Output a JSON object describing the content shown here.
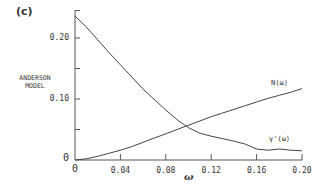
{
  "panel_label": "(c)",
  "chart_data": {
    "type": "line",
    "title": "",
    "ylabel": "ANDERSON MODEL",
    "xlabel": "ω",
    "xlim": [
      0,
      0.2
    ],
    "ylim": [
      0,
      0.24
    ],
    "x_ticks": [
      "0",
      "0.04",
      "0.08",
      "0.12",
      "0.16",
      "0.20"
    ],
    "y_ticks": [
      "0",
      "0.10",
      "0.20"
    ],
    "grid": false,
    "series": [
      {
        "name": "N(ω)",
        "x": [
          0,
          0.01,
          0.02,
          0.03,
          0.04,
          0.05,
          0.06,
          0.07,
          0.08,
          0.09,
          0.1,
          0.11,
          0.12,
          0.13,
          0.14,
          0.15,
          0.16,
          0.17,
          0.18,
          0.19,
          0.2
        ],
        "values": [
          0,
          0.002,
          0.006,
          0.011,
          0.016,
          0.022,
          0.029,
          0.036,
          0.043,
          0.05,
          0.057,
          0.064,
          0.071,
          0.077,
          0.083,
          0.089,
          0.095,
          0.101,
          0.106,
          0.111,
          0.117
        ]
      },
      {
        "name": "γ'(ω)",
        "x": [
          0,
          0.01,
          0.02,
          0.03,
          0.04,
          0.05,
          0.06,
          0.07,
          0.08,
          0.09,
          0.1,
          0.11,
          0.12,
          0.13,
          0.14,
          0.15,
          0.16,
          0.17,
          0.18,
          0.19,
          0.2
        ],
        "values": [
          0.236,
          0.218,
          0.197,
          0.176,
          0.156,
          0.136,
          0.116,
          0.099,
          0.082,
          0.066,
          0.053,
          0.044,
          0.039,
          0.035,
          0.031,
          0.026,
          0.018,
          0.016,
          0.018,
          0.016,
          0.015
        ]
      }
    ],
    "annotations": [
      {
        "text": "N(ω)",
        "x": 0.17,
        "y": 0.12
      },
      {
        "text": "γ'(ω)",
        "x": 0.175,
        "y": 0.03
      }
    ]
  }
}
